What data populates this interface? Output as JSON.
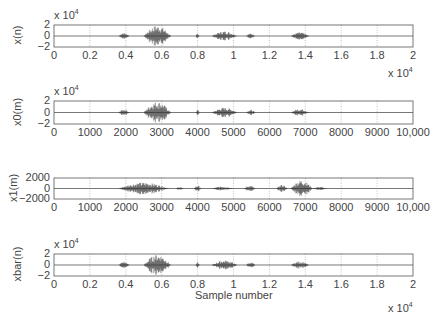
{
  "chart_data": [
    {
      "type": "line",
      "ylabel": "x(n)",
      "y_multiplier": "x 10^4",
      "x_multiplier": "x 10^4",
      "yticks": [
        "2",
        "0",
        "−2"
      ],
      "ylim": [
        -2,
        2
      ],
      "xticks": [
        "0",
        "0.2",
        "0.4",
        "0.6",
        "0.8",
        "1",
        "1.2",
        "1.4",
        "1.6",
        "1.8",
        "2"
      ],
      "xlim": [
        0,
        20000
      ],
      "grid": true,
      "bursts": [
        [
          0.36,
          0.42,
          0.3
        ],
        [
          0.5,
          0.65,
          1.0
        ],
        [
          0.79,
          0.81,
          0.25
        ],
        [
          0.88,
          1.02,
          0.45
        ],
        [
          1.07,
          1.12,
          0.25
        ],
        [
          1.32,
          1.42,
          0.35
        ]
      ]
    },
    {
      "type": "line",
      "ylabel": "x0(m)",
      "y_multiplier": "x 10^4",
      "yticks": [
        "2",
        "0",
        "−2"
      ],
      "ylim": [
        -2,
        2
      ],
      "xticks": [
        "0",
        "1000",
        "2000",
        "3000",
        "4000",
        "5000",
        "6000",
        "7000",
        "8000",
        "9000",
        "10,000"
      ],
      "xlim": [
        0,
        10000
      ],
      "grid": true,
      "bursts": [
        [
          0.18,
          0.21,
          0.3
        ],
        [
          0.25,
          0.325,
          1.0
        ],
        [
          0.395,
          0.405,
          0.25
        ],
        [
          0.44,
          0.51,
          0.45
        ],
        [
          0.535,
          0.56,
          0.25
        ],
        [
          0.66,
          0.71,
          0.35
        ]
      ]
    },
    {
      "type": "line",
      "ylabel": "x1(m)",
      "yticks": [
        "2000",
        "0",
        "−2000"
      ],
      "ylim": [
        -2000,
        2000
      ],
      "xticks": [
        "0",
        "1000",
        "2000",
        "3000",
        "4000",
        "5000",
        "6000",
        "7000",
        "8000",
        "9000",
        "10,000"
      ],
      "xlim": [
        0,
        10000
      ],
      "grid": true,
      "bursts": [
        [
          0.18,
          0.32,
          0.6
        ],
        [
          0.34,
          0.36,
          0.15
        ],
        [
          0.39,
          0.41,
          0.3
        ],
        [
          0.44,
          0.5,
          0.2
        ],
        [
          0.53,
          0.56,
          0.3
        ],
        [
          0.62,
          0.65,
          0.35
        ],
        [
          0.66,
          0.72,
          0.85
        ],
        [
          0.72,
          0.76,
          0.15
        ]
      ]
    },
    {
      "type": "line",
      "ylabel": "xbar(n)",
      "y_multiplier": "x 10^4",
      "x_multiplier": "x 10^4",
      "xlabel": "Sample number",
      "yticks": [
        "2",
        "0",
        "−2"
      ],
      "ylim": [
        -2,
        2
      ],
      "xticks": [
        "0",
        "0.2",
        "0.4",
        "0.6",
        "0.8",
        "1",
        "1.2",
        "1.4",
        "1.6",
        "1.8",
        "2"
      ],
      "xlim": [
        0,
        20000
      ],
      "grid": true,
      "bursts": [
        [
          0.36,
          0.42,
          0.3
        ],
        [
          0.5,
          0.65,
          1.0
        ],
        [
          0.79,
          0.81,
          0.25
        ],
        [
          0.88,
          1.02,
          0.45
        ],
        [
          1.07,
          1.12,
          0.25
        ],
        [
          1.32,
          1.42,
          0.35
        ]
      ]
    }
  ],
  "labels": {
    "p1_ylabel": "x(n)",
    "p2_ylabel": "x0(m)",
    "p3_ylabel": "x1(m)",
    "p4_ylabel": "xbar(n)",
    "multiplier_base": "x 10",
    "multiplier_exp": "4",
    "xlabel": "Sample number"
  }
}
